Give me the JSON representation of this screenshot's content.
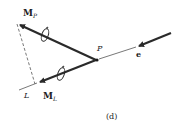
{
  "figure": {
    "caption": "(d)",
    "labels": {
      "mp_main": "M",
      "mp_sub": "P",
      "ml_main": "M",
      "ml_sub": "L",
      "point_p": "P",
      "axis_l": "L",
      "unit_e": "e"
    },
    "colors": {
      "arrow": "#2a2a2a",
      "thin_line": "#555555",
      "text": "#222222"
    }
  }
}
